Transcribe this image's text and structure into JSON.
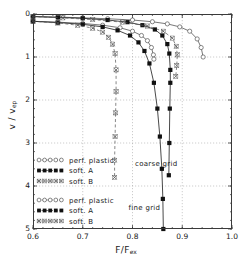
{
  "chart_data": {
    "type": "line",
    "title": "",
    "xlabel": "F/F_ex",
    "ylabel": "v / v_ep",
    "xlim": [
      0.6,
      1.0
    ],
    "ylim": [
      0,
      5
    ],
    "y_inverted": true,
    "grid": true,
    "xticks": [
      "0.6",
      "0.7",
      "0.8",
      "0.9",
      "1.0"
    ],
    "xtick_values": [
      0.6,
      0.7,
      0.8,
      0.9,
      1.0
    ],
    "yticks": [
      "0",
      "1",
      "2",
      "3",
      "4",
      "5"
    ],
    "ytick_values": [
      0,
      1,
      2,
      3,
      4,
      5
    ],
    "annotations": [
      {
        "text": "coarse grid",
        "x": 0.805,
        "y": 3.53
      },
      {
        "text": "fine grid",
        "x": 0.792,
        "y": 4.55
      }
    ],
    "series": [
      {
        "name": "perf. plastic (coarse grid)",
        "grid": "coarse",
        "marker": "open-circle",
        "line": "solid",
        "color": "#555555",
        "points": [
          [
            0.6,
            0.06
          ],
          [
            0.65,
            0.07
          ],
          [
            0.7,
            0.09
          ],
          [
            0.75,
            0.11
          ],
          [
            0.8,
            0.14
          ],
          [
            0.84,
            0.18
          ],
          [
            0.87,
            0.23
          ],
          [
            0.895,
            0.3
          ],
          [
            0.915,
            0.4
          ],
          [
            0.93,
            0.58
          ],
          [
            0.938,
            0.78
          ],
          [
            0.942,
            1.0
          ]
        ]
      },
      {
        "name": "soft. A (coarse grid)",
        "grid": "coarse",
        "marker": "filled-square",
        "line": "solid",
        "color": "#1a1a1a",
        "points": [
          [
            0.6,
            0.06
          ],
          [
            0.65,
            0.08
          ],
          [
            0.7,
            0.1
          ],
          [
            0.75,
            0.14
          ],
          [
            0.79,
            0.19
          ],
          [
            0.82,
            0.26
          ],
          [
            0.845,
            0.36
          ],
          [
            0.86,
            0.5
          ],
          [
            0.87,
            0.7
          ],
          [
            0.874,
            0.92
          ],
          [
            0.876,
            1.3
          ],
          [
            0.876,
            1.6
          ],
          [
            0.875,
            2.2
          ],
          [
            0.874,
            3.0
          ],
          [
            0.873,
            3.75
          ]
        ]
      },
      {
        "name": "soft. B (coarse grid)",
        "grid": "coarse",
        "marker": "x-mark",
        "line": "dashed",
        "color": "#555555",
        "points": [
          [
            0.6,
            0.06
          ],
          [
            0.66,
            0.09
          ],
          [
            0.72,
            0.13
          ],
          [
            0.78,
            0.19
          ],
          [
            0.83,
            0.28
          ],
          [
            0.862,
            0.4
          ],
          [
            0.88,
            0.56
          ],
          [
            0.888,
            0.75
          ],
          [
            0.89,
            0.95
          ],
          [
            0.889,
            1.2
          ],
          [
            0.887,
            1.45
          ]
        ]
      },
      {
        "name": "perf. plastic (fine grid)",
        "grid": "fine",
        "marker": "open-circle",
        "line": "solid",
        "color": "#555555",
        "points": [
          [
            0.6,
            0.17
          ],
          [
            0.65,
            0.19
          ],
          [
            0.7,
            0.22
          ],
          [
            0.74,
            0.26
          ],
          [
            0.775,
            0.32
          ],
          [
            0.8,
            0.4
          ],
          [
            0.818,
            0.5
          ],
          [
            0.83,
            0.62
          ],
          [
            0.838,
            0.78
          ],
          [
            0.842,
            0.95
          ],
          [
            0.843,
            1.05
          ]
        ]
      },
      {
        "name": "soft. A (fine grid)",
        "grid": "fine",
        "marker": "filled-square",
        "line": "solid",
        "color": "#1a1a1a",
        "points": [
          [
            0.6,
            0.17
          ],
          [
            0.65,
            0.2
          ],
          [
            0.7,
            0.24
          ],
          [
            0.74,
            0.3
          ],
          [
            0.77,
            0.38
          ],
          [
            0.795,
            0.5
          ],
          [
            0.812,
            0.66
          ],
          [
            0.824,
            0.86
          ],
          [
            0.834,
            1.15
          ],
          [
            0.843,
            1.6
          ],
          [
            0.85,
            2.2
          ],
          [
            0.855,
            2.85
          ],
          [
            0.859,
            3.6
          ],
          [
            0.861,
            4.3
          ],
          [
            0.862,
            5.0
          ]
        ]
      },
      {
        "name": "soft. B (fine grid)",
        "grid": "fine",
        "marker": "x-mark",
        "line": "dashed",
        "color": "#555555",
        "points": [
          [
            0.6,
            0.17
          ],
          [
            0.65,
            0.21
          ],
          [
            0.69,
            0.26
          ],
          [
            0.72,
            0.33
          ],
          [
            0.74,
            0.42
          ],
          [
            0.752,
            0.54
          ],
          [
            0.76,
            0.7
          ],
          [
            0.765,
            0.92
          ],
          [
            0.767,
            1.3
          ],
          [
            0.767,
            1.8
          ],
          [
            0.766,
            2.3
          ],
          [
            0.765,
            2.85
          ],
          [
            0.764,
            3.4
          ],
          [
            0.764,
            3.8
          ]
        ]
      }
    ],
    "legends": [
      {
        "group": "coarse grid",
        "entries": [
          {
            "marker": "open-circle",
            "line": "dashed",
            "label": "perf. plastic"
          },
          {
            "marker": "filled-square",
            "line": "solid",
            "label": "soft. A"
          },
          {
            "marker": "x-mark",
            "line": "solid",
            "label": "soft. B"
          }
        ]
      },
      {
        "group": "fine grid",
        "entries": [
          {
            "marker": "open-circle",
            "line": "dashed",
            "label": "perf. plastic"
          },
          {
            "marker": "filled-square",
            "line": "solid",
            "label": "soft. A"
          },
          {
            "marker": "x-mark",
            "line": "solid",
            "label": "soft. B"
          }
        ]
      }
    ]
  }
}
